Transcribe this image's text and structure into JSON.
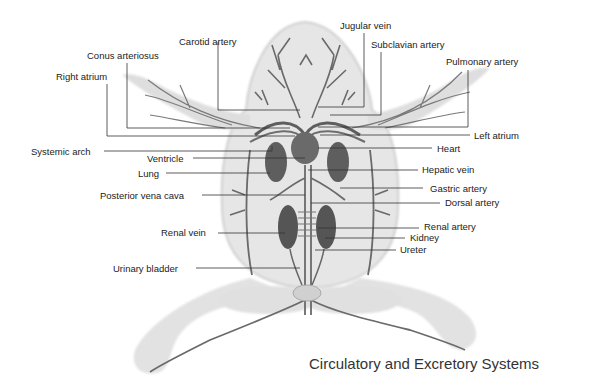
{
  "figure": {
    "title": "Circulatory and Excretory Systems",
    "colors": {
      "body_fill": "#e4e4e4",
      "body_edge": "#cfcfcf",
      "vessel": "#6a6a6a",
      "organ": "#5a5a5a",
      "leader": "#333333",
      "text": "#222222"
    }
  },
  "labels": {
    "carotid_artery": "Carotid artery",
    "jugular_vein": "Jugular vein",
    "subclavian_artery": "Subclavian artery",
    "conus_arteriosus": "Conus arteriosus",
    "pulmonary_artery": "Pulmonary artery",
    "right_atrium": "Right atrium",
    "left_atrium": "Left atrium",
    "systemic_arch": "Systemic arch",
    "heart": "Heart",
    "ventricle": "Ventricle",
    "hepatic_vein": "Hepatic vein",
    "lung": "Lung",
    "posterior_vena_cava": "Posterior vena cava",
    "gastric_artery": "Gastric artery",
    "dorsal_artery": "Dorsal artery",
    "renal_artery": "Renal artery",
    "renal_vein": "Renal vein",
    "kidney": "Kidney",
    "ureter": "Ureter",
    "urinary_bladder": "Urinary bladder"
  }
}
